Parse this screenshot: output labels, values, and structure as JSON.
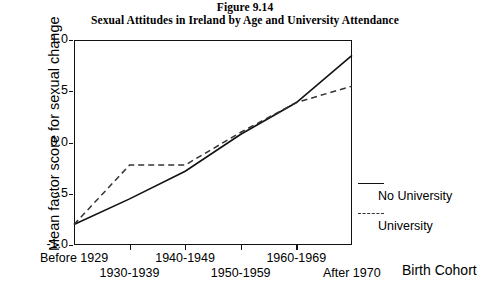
{
  "figure": {
    "label": "Figure 9.14",
    "title": "Sexual Attitudes in Ireland by Age and University Attendance"
  },
  "axes": {
    "y_title": "Mean factor score  for sexual change",
    "x_title": "Birth Cohort",
    "y_ticks": [
      "1.0",
      ".5",
      "0.0",
      "-.5",
      "-1.0"
    ],
    "y_tick_values": [
      1.0,
      0.5,
      0.0,
      -0.5,
      -1.0
    ]
  },
  "legend": {
    "entries": [
      {
        "label": "No University",
        "style": "solid",
        "color": "#111111"
      },
      {
        "label": "University",
        "style": "dashed",
        "color": "#333333"
      }
    ]
  },
  "chart_data": {
    "type": "line",
    "title": "Sexual Attitudes in Ireland by Age and University Attendance",
    "subtitle": "Figure 9.14",
    "xlabel": "Birth Cohort",
    "ylabel": "Mean factor score  for sexual change",
    "categories": [
      "Before 1929",
      "1930-1939",
      "1940-1949",
      "1950-1959",
      "1960-1969",
      "After 1970"
    ],
    "series": [
      {
        "name": "No University",
        "style": "solid",
        "color": "#111111",
        "values": [
          -0.8,
          -0.55,
          -0.28,
          0.08,
          0.39,
          0.85
        ]
      },
      {
        "name": "University",
        "style": "dashed",
        "color": "#333333",
        "values": [
          -0.8,
          -0.22,
          -0.22,
          0.1,
          0.39,
          0.55
        ]
      }
    ],
    "ylim": [
      -1.0,
      1.0
    ],
    "yticks": [
      -1.0,
      -0.5,
      0.0,
      0.5,
      1.0
    ],
    "grid": false,
    "legend_position": "right"
  }
}
